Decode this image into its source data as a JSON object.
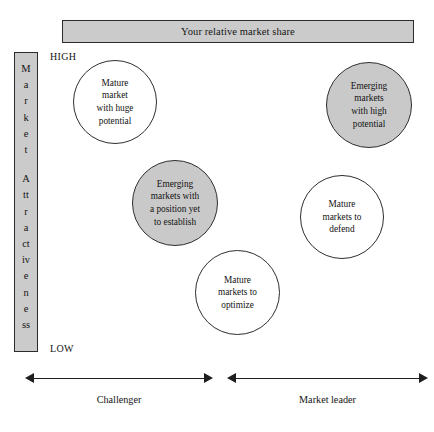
{
  "figure": {
    "title_bar": {
      "label": "Your relative market share"
    },
    "vertical_axis": {
      "label": "Market Attractiveness",
      "characters": [
        "M",
        "a",
        "r",
        "k",
        "e",
        "t",
        "",
        "A",
        "tt",
        "r",
        "a",
        "ct",
        "iv",
        "e",
        "n",
        "e",
        "ss"
      ],
      "high_label": "HIGH",
      "low_label": "LOW"
    },
    "horizontal_axis": {
      "segments": [
        {
          "caption": "Challenger"
        },
        {
          "caption": "Market leader"
        }
      ]
    },
    "bubbles": [
      {
        "id": "mature-market-huge-potential",
        "text": "Mature\nmarket\nwith huge\npotential",
        "fill": "white",
        "x": 73,
        "y": 60,
        "size": 84
      },
      {
        "id": "emerging-markets-high-potential",
        "text": "Emerging\nmarkets\nwith high\npotential",
        "fill": "shaded",
        "x": 326,
        "y": 62,
        "size": 86
      },
      {
        "id": "emerging-markets-position-yet-to-establish",
        "text": "Emerging\nmarkets with\na position yet\nto establish",
        "fill": "shaded",
        "x": 132,
        "y": 160,
        "size": 86
      },
      {
        "id": "mature-markets-to-defend",
        "text": "Mature\nmarkets to\ndefend",
        "fill": "white",
        "x": 300,
        "y": 175,
        "size": 84
      },
      {
        "id": "mature-markets-to-optimize",
        "text": "Mature\nmarkets to\noptimize",
        "fill": "white",
        "x": 195,
        "y": 250,
        "size": 85
      }
    ],
    "colors": {
      "shaded_fill": "#c9c9c9",
      "bar_fill": "#cbcbcb",
      "stroke": "#2b2b2b",
      "background": "#ffffff"
    }
  }
}
